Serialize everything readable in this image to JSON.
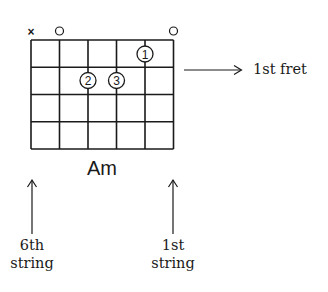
{
  "diagram": {
    "type": "guitar-chord-chart",
    "chord_name": "Am",
    "strings": 6,
    "frets_shown": 4,
    "open_muted_markers": [
      {
        "string": 6,
        "marker": "×",
        "meaning": "muted"
      },
      {
        "string": 5,
        "marker": "○",
        "meaning": "open"
      },
      {
        "string": 1,
        "marker": "○",
        "meaning": "open"
      }
    ],
    "finger_positions": [
      {
        "finger": "1",
        "string": 2,
        "fret": 1
      },
      {
        "finger": "2",
        "string": 4,
        "fret": 2
      },
      {
        "finger": "3",
        "string": 3,
        "fret": 2
      }
    ],
    "annotations": {
      "fret_label": "1st fret",
      "left_label_line1": "6th",
      "left_label_line2": "string",
      "right_label_line1": "1st",
      "right_label_line2": "string"
    },
    "colors": {
      "ink": "#1a1a1a",
      "background": "#ffffff"
    }
  }
}
